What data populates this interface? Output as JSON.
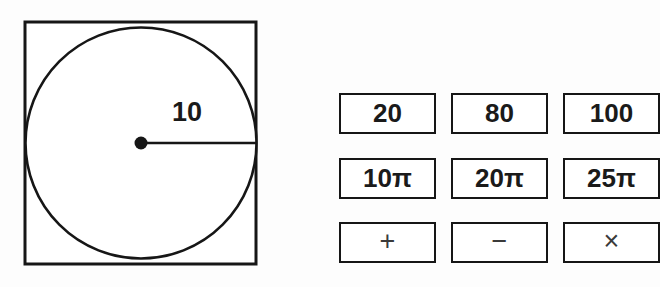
{
  "figure": {
    "name": "circle-inscribed-in-square",
    "shapes": {
      "square": {
        "x": 25,
        "y": 22,
        "width": 231,
        "height": 242
      },
      "circle": {
        "cx": 141,
        "cy": 143,
        "r": 115.5
      },
      "center_dot": {
        "cx": 141,
        "cy": 143,
        "r": 6
      },
      "radius_line": {
        "x1": 141,
        "y1": 143,
        "x2": 256,
        "y2": 143
      }
    },
    "radius_label": "10",
    "stroke_color": "#161616",
    "fill_color": "#ffffff"
  },
  "choices": {
    "rows": [
      {
        "cells": [
          {
            "label": "20"
          },
          {
            "label": "80"
          },
          {
            "label": "100"
          }
        ]
      },
      {
        "cells": [
          {
            "label": "10π"
          },
          {
            "label": "20π"
          },
          {
            "label": "25π"
          }
        ]
      },
      {
        "cells": [
          {
            "label": "+"
          },
          {
            "label": "−"
          },
          {
            "label": "×"
          }
        ]
      }
    ]
  },
  "colors": {
    "background": "#fdfdfd",
    "ink": "#1a1a1a",
    "border": "#161616",
    "operator_ink": "#3a3a3a"
  }
}
